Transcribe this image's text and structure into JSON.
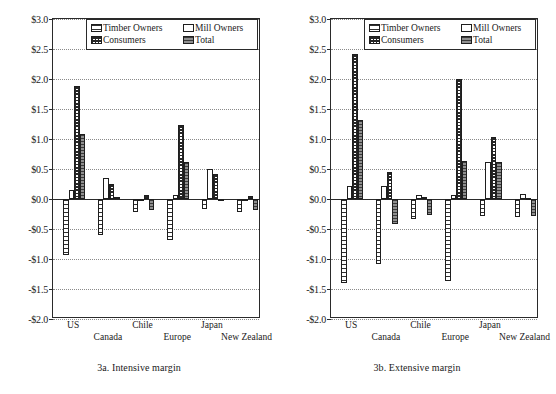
{
  "figure": {
    "panels": [
      {
        "id": "3a",
        "caption": "3a.  Intensive margin"
      },
      {
        "id": "3b",
        "caption": "3b.  Extensive margin"
      }
    ]
  },
  "legend": {
    "position": "top-center-inside",
    "entries": [
      {
        "label": "Timber Owners",
        "pattern": "timber"
      },
      {
        "label": "Mill Owners",
        "pattern": "mill"
      },
      {
        "label": "Consumers",
        "pattern": "consumers"
      },
      {
        "label": "Total",
        "pattern": "total"
      }
    ]
  },
  "axis": {
    "yticks": [
      "$3.0",
      "$2.5",
      "$2.0",
      "$1.5",
      "$1.0",
      "$0.5",
      "$0.0",
      "-$0.5",
      "-$1.0",
      "-$1.5",
      "-$2.0"
    ],
    "ytick_values": [
      3.0,
      2.5,
      2.0,
      1.5,
      1.0,
      0.5,
      0.0,
      -0.5,
      -1.0,
      -1.5,
      -2.0
    ],
    "ylim": [
      -2.0,
      3.0
    ],
    "grid": true
  },
  "chart_data": [
    {
      "type": "bar",
      "title": "3a.  Intensive margin",
      "xlabel": "",
      "ylabel": "",
      "ylim": [
        -2.0,
        3.0
      ],
      "grid": true,
      "legend_position": "top-center-inside",
      "categories": [
        "US",
        "Canada",
        "Chile",
        "Europe",
        "Japan",
        "New Zealand"
      ],
      "series": [
        {
          "name": "Timber Owners",
          "values": [
            -0.93,
            -0.6,
            -0.22,
            -0.68,
            -0.17,
            -0.22
          ]
        },
        {
          "name": "Mill Owners",
          "values": [
            0.15,
            0.35,
            -0.02,
            0.07,
            0.5,
            -0.03
          ]
        },
        {
          "name": "Consumers",
          "values": [
            1.88,
            0.25,
            0.07,
            1.24,
            0.42,
            0.05
          ]
        },
        {
          "name": "Total",
          "values": [
            1.08,
            0.03,
            -0.18,
            0.62,
            -0.01,
            -0.19
          ]
        }
      ]
    },
    {
      "type": "bar",
      "title": "3b.  Extensive margin",
      "xlabel": "",
      "ylabel": "",
      "ylim": [
        -2.0,
        3.0
      ],
      "grid": true,
      "legend_position": "top-center-inside",
      "categories": [
        "US",
        "Canada",
        "Chile",
        "Europe",
        "Japan",
        "New Zealand"
      ],
      "series": [
        {
          "name": "Timber Owners",
          "values": [
            -1.4,
            -1.08,
            -0.33,
            -1.37,
            -0.29,
            -0.3
          ]
        },
        {
          "name": "Mill Owners",
          "values": [
            0.22,
            0.22,
            0.06,
            0.06,
            0.62,
            0.08
          ]
        },
        {
          "name": "Consumers",
          "values": [
            2.42,
            0.45,
            0.03,
            2.0,
            1.03,
            0.02
          ]
        },
        {
          "name": "Total",
          "values": [
            1.32,
            -0.42,
            -0.27,
            0.63,
            0.62,
            -0.28
          ]
        }
      ]
    }
  ]
}
